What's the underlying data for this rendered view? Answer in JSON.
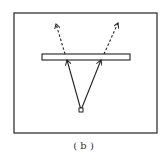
{
  "figure": {
    "caption": "( b )",
    "colors": {
      "stroke": "#222222",
      "frame": "#333333",
      "background": "#ffffff"
    },
    "frame": {
      "x": 14,
      "y": 13,
      "width": 143,
      "height": 120
    },
    "plate": {
      "x": 42,
      "y": 54,
      "width": 88,
      "height": 6
    },
    "source_point": {
      "x": 81,
      "y": 110
    },
    "rays": [
      {
        "name": "left",
        "solid_from": [
          81,
          110
        ],
        "solid_to": [
          67,
          60
        ],
        "dashed_from": [
          65,
          54
        ],
        "dashed_to": [
          56,
          24
        ]
      },
      {
        "name": "right",
        "solid_from": [
          81,
          110
        ],
        "solid_to": [
          101,
          60
        ],
        "dashed_from": [
          104,
          54
        ],
        "dashed_to": [
          118,
          23
        ]
      }
    ]
  }
}
